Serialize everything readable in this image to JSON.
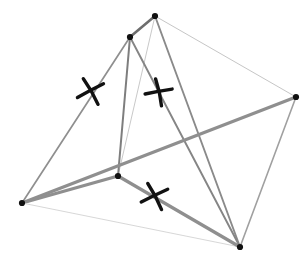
{
  "figure": {
    "title": "Wireframe polyhedron with congruence tick marks",
    "background_color": "#ffffff",
    "width": 308,
    "height": 258,
    "palette": {
      "vertex_color": "#111111",
      "edge_dark": "#6e6e6e",
      "edge_mid": "#8a8a8a",
      "edge_light": "#b4b4b4",
      "edge_faint": "#d2d2d2",
      "tick_color": "#111111"
    }
  },
  "vertices": [
    {
      "id": "A",
      "label": "top-apex",
      "x": 155,
      "y": 16
    },
    {
      "id": "B",
      "label": "upper-left",
      "x": 130,
      "y": 37
    },
    {
      "id": "C",
      "label": "right",
      "x": 296,
      "y": 97
    },
    {
      "id": "D",
      "label": "center",
      "x": 118,
      "y": 176
    },
    {
      "id": "E",
      "label": "left",
      "x": 22,
      "y": 203
    },
    {
      "id": "F",
      "label": "bottom-right",
      "x": 240,
      "y": 247
    }
  ],
  "edges": [
    {
      "id": "e-AB",
      "from": "A",
      "to": "B",
      "weight": 2.6,
      "color": "#6e6e6e"
    },
    {
      "id": "e-AC",
      "from": "A",
      "to": "C",
      "weight": 1.0,
      "color": "#c6c6c6"
    },
    {
      "id": "e-AD",
      "from": "A",
      "to": "D",
      "weight": 1.0,
      "color": "#c9c9c9"
    },
    {
      "id": "e-AF",
      "from": "A",
      "to": "F",
      "weight": 1.9,
      "color": "#8a8a8a"
    },
    {
      "id": "e-BE",
      "from": "B",
      "to": "E",
      "weight": 1.7,
      "color": "#8f8f8f"
    },
    {
      "id": "e-BD",
      "from": "B",
      "to": "D",
      "weight": 2.0,
      "color": "#7e7e7e"
    },
    {
      "id": "e-BF",
      "from": "B",
      "to": "F",
      "weight": 1.9,
      "color": "#858585"
    },
    {
      "id": "e-CE",
      "from": "C",
      "to": "E",
      "weight": 3.2,
      "color": "#8f8f8f"
    },
    {
      "id": "e-CF",
      "from": "C",
      "to": "F",
      "weight": 1.6,
      "color": "#a0a0a0"
    },
    {
      "id": "e-ED",
      "from": "E",
      "to": "D",
      "weight": 3.2,
      "color": "#8f8f8f"
    },
    {
      "id": "e-EF",
      "from": "E",
      "to": "F",
      "weight": 0.9,
      "color": "#d2d2d2"
    },
    {
      "id": "e-DF",
      "from": "D",
      "to": "F",
      "weight": 3.2,
      "color": "#8f8f8f"
    }
  ],
  "tick_marks": [
    {
      "id": "tick-1",
      "label": "congruence-mark-on-edge-BE",
      "on_edge": "e-BE",
      "x": 91,
      "y": 91,
      "rotation_deg": -22,
      "arm_length": 15,
      "stroke_width": 3.4
    },
    {
      "id": "tick-2",
      "label": "congruence-mark-on-edge-BD",
      "on_edge": "e-BD",
      "x": 159,
      "y": 92,
      "rotation_deg": -4,
      "arm_length": 14,
      "stroke_width": 3.4
    },
    {
      "id": "tick-3",
      "label": "congruence-mark-on-edge-DF",
      "on_edge": "e-DF",
      "x": 155,
      "y": 196,
      "rotation_deg": -20,
      "arm_length": 15,
      "stroke_width": 3.4
    }
  ],
  "vertex_dot_radius": 3.1,
  "caption": ""
}
